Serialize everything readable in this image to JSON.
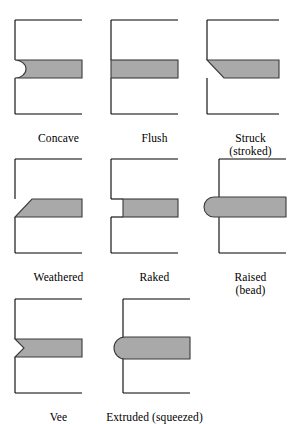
{
  "figure": {
    "name": "mortar-joint-profiles",
    "background_color": "#ffffff",
    "brick_outline_color": "#000000",
    "mortar_fill_color": "#a9a9a9",
    "mortar_outline_color": "#3a3a3a",
    "text_color": "#000000",
    "columns": 3,
    "rows": 3
  },
  "joints": [
    {
      "id": "concave",
      "label": "Concave",
      "sublabel": "",
      "profile": "concave",
      "description": "mortar face curved inward",
      "row": 1,
      "column": 1
    },
    {
      "id": "flush",
      "label": "Flush",
      "sublabel": "",
      "profile": "flush",
      "description": "mortar face even with brick face",
      "row": 1,
      "column": 2
    },
    {
      "id": "struck",
      "label": "Struck",
      "sublabel": "(stroked)",
      "profile": "struck",
      "description": "mortar sloped back at top",
      "row": 1,
      "column": 3
    },
    {
      "id": "weathered",
      "label": "Weathered",
      "sublabel": "",
      "profile": "weathered",
      "description": "mortar sloped back at bottom",
      "row": 2,
      "column": 1
    },
    {
      "id": "raked",
      "label": "Raked",
      "sublabel": "",
      "profile": "raked",
      "description": "mortar recessed square behind face",
      "row": 2,
      "column": 2
    },
    {
      "id": "raised",
      "label": "Raised",
      "sublabel": "(bead)",
      "profile": "raised",
      "description": "mortar projecting with rounded bead",
      "row": 2,
      "column": 3
    },
    {
      "id": "vee",
      "label": "Vee",
      "sublabel": "",
      "profile": "vee",
      "description": "mortar face with V notch",
      "row": 3,
      "column": 1
    },
    {
      "id": "extruded",
      "label": "Extruded (squeezed)",
      "sublabel": "",
      "profile": "extruded",
      "description": "mortar squeezed out beyond face",
      "row": 3,
      "column": 2
    }
  ]
}
